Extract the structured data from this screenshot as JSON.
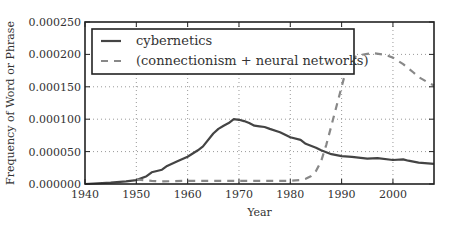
{
  "chart_data": {
    "type": "line",
    "title": "",
    "xlabel": "Year",
    "ylabel": "Frequency of Word or Phrase",
    "xlim": [
      1940,
      2008
    ],
    "ylim": [
      0,
      0.00025
    ],
    "grid": true,
    "legend_position": "top-left",
    "x_ticks": [
      1940,
      1950,
      1960,
      1970,
      1980,
      1990,
      2000
    ],
    "x_tick_labels": [
      "1940",
      "1950",
      "1960",
      "1970",
      "1980",
      "1990",
      "2000"
    ],
    "y_ticks": [
      0,
      5e-05,
      0.0001,
      0.00015,
      0.0002,
      0.00025
    ],
    "y_tick_labels": [
      "0.000000",
      "0.000050",
      "0.000100",
      "0.000150",
      "0.000200",
      "0.000250"
    ],
    "series": [
      {
        "name": "cybernetics",
        "style": "solid",
        "color": "#444444",
        "x": [
          1940,
          1945,
          1948,
          1950,
          1952,
          1953,
          1955,
          1956,
          1958,
          1960,
          1962,
          1963,
          1965,
          1966,
          1967,
          1968,
          1969,
          1970,
          1971,
          1972,
          1973,
          1974,
          1975,
          1976,
          1978,
          1980,
          1982,
          1983,
          1985,
          1986,
          1988,
          1990,
          1992,
          1995,
          1997,
          2000,
          2002,
          2003,
          2005,
          2008
        ],
        "values": [
          0.0,
          2e-06,
          4e-06,
          6e-06,
          1.2e-05,
          1.8e-05,
          2.2e-05,
          2.8e-05,
          3.5e-05,
          4.2e-05,
          5.2e-05,
          5.8e-05,
          7.8e-05,
          8.5e-05,
          9e-05,
          9.4e-05,
          0.0001,
          9.9e-05,
          9.7e-05,
          9.4e-05,
          9e-05,
          8.9e-05,
          8.8e-05,
          8.5e-05,
          8e-05,
          7.2e-05,
          6.8e-05,
          6.2e-05,
          5.6e-05,
          5.2e-05,
          4.6e-05,
          4.3e-05,
          4.2e-05,
          3.9e-05,
          4e-05,
          3.7e-05,
          3.8e-05,
          3.6e-05,
          3.3e-05,
          3.1e-05
        ]
      },
      {
        "name": "(connectionism + neural networks)",
        "style": "dashed",
        "color": "#888888",
        "x": [
          1950,
          1953,
          1955,
          1960,
          1965,
          1970,
          1975,
          1980,
          1982,
          1983,
          1984,
          1985,
          1986,
          1987,
          1988,
          1989,
          1990,
          1991,
          1992,
          1993,
          1995,
          1996,
          1998,
          1999,
          2000,
          2002,
          2004,
          2005,
          2007,
          2008
        ],
        "values": [
          7e-06,
          5e-06,
          4e-06,
          5e-06,
          5e-06,
          5e-06,
          5e-06,
          5e-06,
          6e-06,
          8e-06,
          1.2e-05,
          2e-05,
          3.5e-05,
          6e-05,
          9e-05,
          0.00012,
          0.00015,
          0.00018,
          0.000192,
          0.000198,
          0.000201,
          0.000202,
          0.0002,
          0.000198,
          0.000195,
          0.000185,
          0.000172,
          0.000165,
          0.000156,
          0.000152
        ]
      }
    ]
  }
}
